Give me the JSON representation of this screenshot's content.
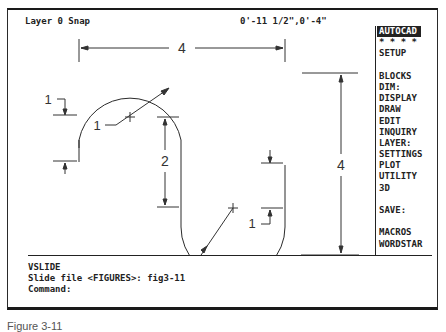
{
  "status_bar": {
    "layer_snap": "Layer 0 Snap",
    "coordinates": "0'-11 1/2\",0'-4\""
  },
  "screen_menu": {
    "items": [
      {
        "label": "AUTOCAD",
        "active": true
      },
      {
        "label": "* * * *"
      },
      {
        "label": "SETUP"
      },
      {
        "label": ""
      },
      {
        "label": "BLOCKS"
      },
      {
        "label": "DIM:"
      },
      {
        "label": "DISPLAY"
      },
      {
        "label": "DRAW"
      },
      {
        "label": "EDIT"
      },
      {
        "label": "INQUIRY"
      },
      {
        "label": "LAYER:"
      },
      {
        "label": "SETTINGS"
      },
      {
        "label": "PLOT"
      },
      {
        "label": "UTILITY"
      },
      {
        "label": "3D"
      },
      {
        "label": ""
      },
      {
        "label": "SAVE:"
      },
      {
        "label": ""
      },
      {
        "label": "MACROS"
      },
      {
        "label": "WORDSTAR"
      }
    ]
  },
  "drawing": {
    "dimensions": {
      "overall_width": "4",
      "overall_height": "4",
      "straight_length": "2",
      "left_offset": "1",
      "right_offset": "1",
      "upper_radius": "1",
      "lower_radius": "1"
    },
    "colors": {
      "line": "#2a2a2a",
      "dim": "#333333"
    }
  },
  "command_area": {
    "lines": [
      "VSLIDE",
      "Slide file <FIGURES>: fig3-11",
      "Command:"
    ]
  },
  "caption": {
    "text": "Figure 3-11"
  }
}
